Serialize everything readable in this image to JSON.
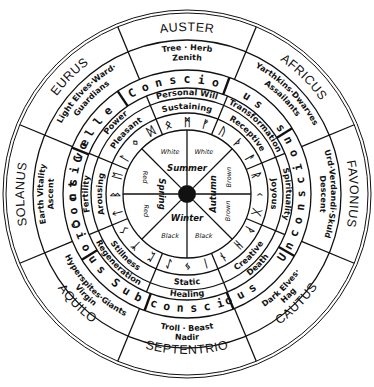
{
  "diagram": {
    "center": [
      187,
      194
    ],
    "winds": [
      {
        "label": "AUSTER",
        "angle": 0
      },
      {
        "label": "AFRICUS",
        "angle": 45
      },
      {
        "label": "FAVONIUS",
        "angle": 90
      },
      {
        "label": "CAUTUS",
        "angle": 135
      },
      {
        "label": "SEPTENTRIO",
        "angle": 180
      },
      {
        "label": "AQUILO",
        "angle": 225
      },
      {
        "label": "SOLANUS",
        "angle": 270
      },
      {
        "label": "EURUS",
        "angle": 315
      }
    ],
    "beings": [
      {
        "line1": "Tree · Herb",
        "line2": "Zenith",
        "angle": 0
      },
      {
        "line1": "Yarthkins·Dwarves",
        "line2": "Assailants",
        "angle": 45
      },
      {
        "line1": "Urd·Verdandi·Skuld",
        "line2": "Descent",
        "angle": 90
      },
      {
        "line1": "Dark Elves·",
        "line2": "Hag",
        "angle": 135
      },
      {
        "line1": "Troll · Beast",
        "line2": "Nadir",
        "angle": 180
      },
      {
        "line1": "Hyperspites·Giants",
        "line2": "Virgin",
        "angle": 225
      },
      {
        "line1": "Earth Vitality",
        "line2": "Ascent",
        "angle": 270
      },
      {
        "line1": "Light Elves·Ward·",
        "line2": "Guardians",
        "angle": 315
      }
    ],
    "consciousness": [
      {
        "text": "n s c i o",
        "angle": 0
      },
      {
        "text": "u s",
        "angle": 35
      },
      {
        "text": "s n o",
        "angle": 62
      },
      {
        "text": "U n c o n s c i",
        "angle": 100
      },
      {
        "text": "o u s",
        "angle": 152
      },
      {
        "text": "c o n s c i",
        "angle": 180
      },
      {
        "text": "S u b",
        "angle": 212
      },
      {
        "text": "c i o u s",
        "angle": 242
      },
      {
        "text": "C o n s",
        "angle": 265
      },
      {
        "text": "c t i v e",
        "angle": 282
      },
      {
        "text": "C o l l e",
        "angle": 302
      },
      {
        "text": "C o",
        "angle": 335
      }
    ],
    "qualities_outer": [
      {
        "text": "Personal Will",
        "angle": 0
      },
      {
        "text": "Transformation",
        "angle": 45
      },
      {
        "text": "Spirituality",
        "angle": 90
      },
      {
        "text": "Death",
        "angle": 135
      },
      {
        "text": "Healing",
        "angle": 180
      },
      {
        "text": "Regeneration",
        "angle": 225
      },
      {
        "text": "Fertility",
        "angle": 270
      },
      {
        "text": "Power",
        "angle": 315
      }
    ],
    "qualities_inner": [
      {
        "text": "Sustaining",
        "angle": 0
      },
      {
        "text": "Receptive",
        "angle": 45
      },
      {
        "text": "Joyous",
        "angle": 90
      },
      {
        "text": "Creative",
        "angle": 135
      },
      {
        "text": "Static",
        "angle": 180
      },
      {
        "text": "Stillness",
        "angle": 225
      },
      {
        "text": "Arousing",
        "angle": 270
      },
      {
        "text": "Pleasant",
        "angle": 315
      }
    ],
    "runes": [
      "ᛗ",
      "ᚠ",
      "ᚢ",
      "ᚦ",
      "ᚨ",
      "ᚱ",
      "ᚲ",
      "ᚷ",
      "ᚹ",
      "ᚺ",
      "ᚾ",
      "ᛁ",
      "ᛃ",
      "ᛇ",
      "ᛈ",
      "ᛉ",
      "ᛊ",
      "ᛏ",
      "ᛒ",
      "ᛖ",
      "ᛚ",
      "ᛜ",
      "ᛞ",
      "ᛟ"
    ],
    "seasons": [
      {
        "name": "Summer",
        "colors": [
          "White",
          "White"
        ]
      },
      {
        "name": "Autumn",
        "colors": [
          "Brown",
          "Brown"
        ]
      },
      {
        "name": "Winter",
        "colors": [
          "Black",
          "Black"
        ]
      },
      {
        "name": "Spring",
        "colors": [
          "Red",
          "Red"
        ]
      }
    ],
    "line_color": "#111111",
    "background": "#ffffff"
  }
}
